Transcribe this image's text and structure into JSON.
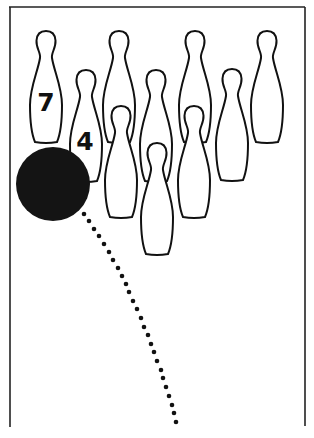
{
  "diagram": {
    "colors": {
      "ink": "#111111",
      "ball": "#141414",
      "background": "#ffffff"
    },
    "lane_frame": {
      "top": {
        "x1": 9,
        "y1": 7,
        "x2": 305,
        "y2": 7
      },
      "left": {
        "x1": 10,
        "y1": 7,
        "x2": 10,
        "y2": 427
      },
      "right": {
        "x1": 305,
        "y1": 7,
        "x2": 305,
        "y2": 426
      }
    },
    "pins": [
      {
        "id": 7,
        "label": "7",
        "cx": 46,
        "top": 31
      },
      {
        "id": 8,
        "label": "",
        "cx": 119,
        "top": 31
      },
      {
        "id": 9,
        "label": "",
        "cx": 195,
        "top": 31
      },
      {
        "id": 10,
        "label": "",
        "cx": 267,
        "top": 31
      },
      {
        "id": 4,
        "label": "4",
        "cx": 86,
        "top": 70
      },
      {
        "id": 5,
        "label": "",
        "cx": 156,
        "top": 70
      },
      {
        "id": 6,
        "label": "",
        "cx": 232,
        "top": 69
      },
      {
        "id": 2,
        "label": "",
        "cx": 121,
        "top": 106
      },
      {
        "id": 3,
        "label": "",
        "cx": 194,
        "top": 106
      },
      {
        "id": 1,
        "label": "",
        "cx": 157,
        "top": 143
      }
    ],
    "pin_labels": {
      "pin7": {
        "text": "7",
        "x": 46,
        "y": 111,
        "size": 25
      },
      "pin4": {
        "text": "4",
        "x": 85,
        "y": 150,
        "size": 25
      }
    },
    "ball": {
      "cx": 53,
      "cy": 184,
      "r": 37
    },
    "trajectory": {
      "dot_radius": 2.3,
      "points": [
        [
          84,
          214
        ],
        [
          89,
          221
        ],
        [
          94,
          229
        ],
        [
          99,
          236
        ],
        [
          104,
          244
        ],
        [
          109,
          252
        ],
        [
          113,
          260
        ],
        [
          118,
          268
        ],
        [
          122,
          276
        ],
        [
          126,
          284
        ],
        [
          129,
          292
        ],
        [
          133,
          301
        ],
        [
          137,
          309
        ],
        [
          141,
          318
        ],
        [
          144,
          327
        ],
        [
          148,
          335
        ],
        [
          151,
          344
        ],
        [
          154,
          352
        ],
        [
          157,
          361
        ],
        [
          161,
          370
        ],
        [
          163,
          378
        ],
        [
          166,
          387
        ],
        [
          169,
          396
        ],
        [
          172,
          405
        ],
        [
          174,
          413
        ],
        [
          176,
          422
        ]
      ]
    }
  }
}
